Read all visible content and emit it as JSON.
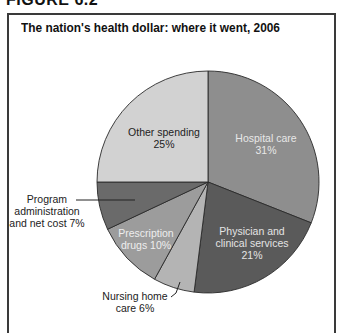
{
  "figure_label": "FIGURE 6.2",
  "title": "The nation's health dollar: where it went, 2006",
  "colors": {
    "hospital": "#8e8e8e",
    "physician": "#5a5a5a",
    "nursing": "#b4b4b4",
    "prescription": "#9c9c9c",
    "admin": "#6a6a6a",
    "other": "#d2d2d2",
    "border": "#2a2a2a"
  },
  "labels": {
    "hospital": [
      "Hospital care",
      "31%"
    ],
    "physician": [
      "Physician and",
      "clinical services",
      "21%"
    ],
    "nursing": [
      "Nursing home",
      "care 6%"
    ],
    "prescription": [
      "Prescription",
      "drugs 10%"
    ],
    "admin": [
      "Program",
      "administration",
      "and net cost 7%"
    ],
    "other": [
      "Other spending",
      "25%"
    ]
  },
  "chart_data": {
    "type": "pie",
    "title": "The nation's health dollar: where it went, 2006",
    "categories": [
      "Hospital care",
      "Physician and clinical services",
      "Nursing home care",
      "Prescription drugs",
      "Program administration and net cost",
      "Other spending"
    ],
    "values": [
      31,
      21,
      6,
      10,
      7,
      25
    ],
    "unit": "%",
    "start_angle": "12 o'clock",
    "direction": "clockwise",
    "legend": "none (direct labels)"
  }
}
